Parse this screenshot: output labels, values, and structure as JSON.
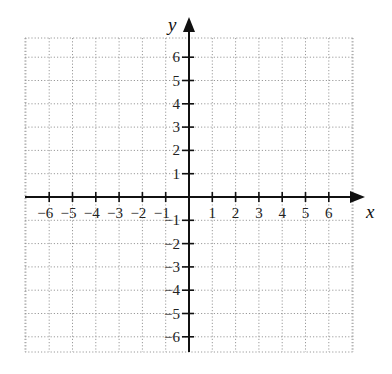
{
  "diagram": {
    "type": "coordinate-plane",
    "x_axis": {
      "label": "x",
      "min": -7,
      "max": 7,
      "ticks": [
        -6,
        -5,
        -4,
        -3,
        -2,
        -1,
        1,
        2,
        3,
        4,
        5,
        6
      ]
    },
    "y_axis": {
      "label": "y",
      "min": -7,
      "max": 7,
      "ticks": [
        -6,
        -5,
        -4,
        -3,
        -2,
        -1,
        1,
        2,
        3,
        4,
        5,
        6
      ]
    },
    "grid": {
      "style": "dotted",
      "color": "#9a9a9a",
      "spacing_units": 1
    },
    "axis_color": "#111111",
    "labels": {
      "x": "x",
      "y": "y",
      "x_ticks": [
        "−6",
        "−5",
        "−4",
        "−3",
        "−2",
        "−1",
        "1",
        "2",
        "3",
        "4",
        "5",
        "6"
      ],
      "y_ticks": [
        "6",
        "5",
        "4",
        "3",
        "2",
        "1",
        "−1",
        "−2",
        "−3",
        "−4",
        "−5",
        "−6"
      ]
    }
  }
}
